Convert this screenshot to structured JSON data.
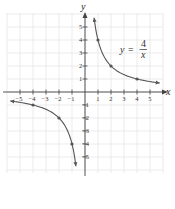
{
  "chart_data": {
    "type": "line",
    "title": "",
    "equation": {
      "lhs": "y",
      "eq": "=",
      "numerator": "4",
      "denominator": "x"
    },
    "xlabel": "x",
    "ylabel": "y",
    "xlim": [
      -6,
      6
    ],
    "ylim": [
      -6,
      6
    ],
    "grid": true,
    "x_ticks": [
      -5,
      -4,
      -3,
      -2,
      -1,
      1,
      2,
      3,
      4,
      5
    ],
    "y_ticks": [
      -5,
      -4,
      -3,
      -2,
      -1,
      1,
      2,
      3,
      4,
      5
    ],
    "series": [
      {
        "name": "y = 4/x (x > 0)",
        "x": [
          0.7,
          1,
          2,
          4,
          5.75
        ],
        "y": [
          5.71,
          4,
          2,
          1,
          0.7
        ],
        "marked_points": [
          [
            1,
            4
          ],
          [
            2,
            2
          ],
          [
            4,
            1
          ]
        ]
      },
      {
        "name": "y = 4/x (x < 0)",
        "x": [
          -5.75,
          -4,
          -2,
          -1,
          -0.7
        ],
        "y": [
          -0.7,
          -1,
          -2,
          -4,
          -5.71
        ],
        "marked_points": [
          [
            -4,
            -1
          ],
          [
            -2,
            -2
          ],
          [
            -1,
            -4
          ]
        ]
      }
    ],
    "colors": {
      "curve": "#555555",
      "axis": "#444444",
      "grid": "#e6e6e6"
    }
  }
}
